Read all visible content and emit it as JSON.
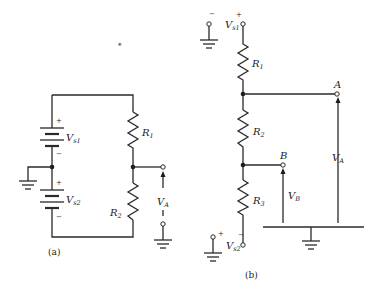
{
  "figure": {
    "panels": [
      {
        "id": "a",
        "caption": "(a)",
        "components": {
          "source1": {
            "symbol": "V",
            "subscript": "s1",
            "plus": "+",
            "minus": "−"
          },
          "source2": {
            "symbol": "V",
            "subscript": "s2",
            "plus": "+",
            "minus": "−"
          },
          "resistor1": {
            "symbol": "R",
            "subscript": "1"
          },
          "resistor2": {
            "symbol": "R",
            "subscript": "2"
          },
          "output_voltage": {
            "symbol": "V",
            "subscript": "A"
          }
        }
      },
      {
        "id": "b",
        "caption": "(b)",
        "components": {
          "source1": {
            "symbol": "V",
            "subscript": "s1",
            "plus": "+",
            "minus": "−"
          },
          "source2": {
            "symbol": "V",
            "subscript": "s2",
            "plus": "+",
            "minus": "−"
          },
          "resistor1": {
            "symbol": "R",
            "subscript": "1"
          },
          "resistor2": {
            "symbol": "R",
            "subscript": "2"
          },
          "resistor3": {
            "symbol": "R",
            "subscript": "3"
          },
          "node_a": "A",
          "node_b": "B",
          "voltage_a": {
            "symbol": "V",
            "subscript": "A"
          },
          "voltage_b": {
            "symbol": "V",
            "subscript": "B"
          }
        }
      }
    ],
    "stray_mark": "*",
    "colors": {
      "ink": "#2a2a2a",
      "background": "#ffffff"
    }
  }
}
